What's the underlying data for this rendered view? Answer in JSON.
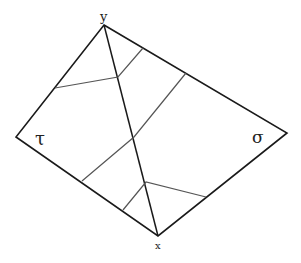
{
  "diagram": {
    "labels": {
      "top": "y",
      "bottom": "x",
      "left": "τ",
      "right": "σ"
    },
    "vertices": {
      "top": [
        104,
        25
      ],
      "left": [
        16,
        137
      ],
      "right": [
        287,
        133
      ],
      "bottom": [
        158,
        236
      ]
    },
    "colors": {
      "outline": "#1a1a1a",
      "inner": "#555555",
      "background": "#ffffff"
    }
  }
}
